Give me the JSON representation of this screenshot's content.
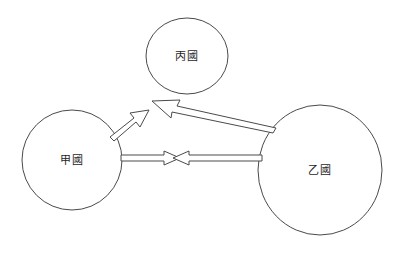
{
  "diagram": {
    "title": "",
    "background_color": "#ffffff",
    "stroke_color": "#4a4a4a",
    "label_color": "#1e1e1e",
    "nodes": [
      {
        "id": "node-bing",
        "label": "丙國",
        "shape": "ellipse",
        "cx": 187,
        "cy": 56,
        "rx": 41,
        "ry": 38
      },
      {
        "id": "node-jia",
        "label": "甲國",
        "shape": "ellipse",
        "cx": 72,
        "cy": 160,
        "rx": 50,
        "ry": 50
      },
      {
        "id": "node-yi",
        "label": "乙國",
        "shape": "ellipse",
        "cx": 320,
        "cy": 170,
        "rx": 62,
        "ry": 65
      }
    ],
    "arrows": [
      {
        "id": "arrow-jia-to-bing",
        "from": "甲國",
        "to": "丙國",
        "direction": "up-right",
        "style": "hollow-block"
      },
      {
        "id": "arrow-yi-to-bing",
        "from": "乙國",
        "to": "丙國",
        "direction": "up-left",
        "style": "hollow-block"
      },
      {
        "id": "arrow-jia-to-yi",
        "from": "甲國",
        "to": "乙國",
        "direction": "right",
        "style": "hollow-block"
      },
      {
        "id": "arrow-yi-to-jia",
        "from": "乙國",
        "to": "甲國",
        "direction": "left",
        "style": "hollow-block"
      }
    ]
  }
}
